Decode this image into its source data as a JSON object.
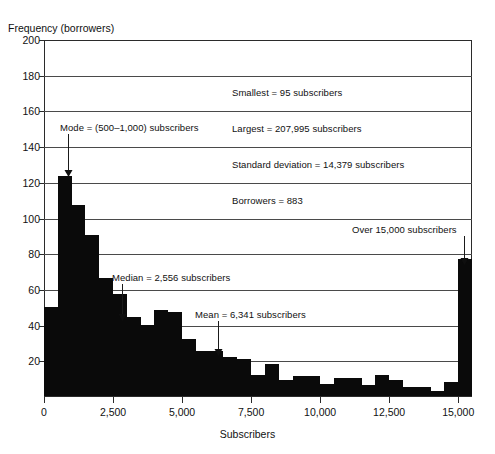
{
  "chart_data": {
    "type": "bar",
    "title": "",
    "subtitle": "",
    "xlabel": "Subscribers",
    "ylabel": "Frequency (borrowers)",
    "xlim": [
      0,
      15500
    ],
    "ylim": [
      0,
      200
    ],
    "grid": true,
    "legend_position": "none",
    "bin_width": 500,
    "x_tick_labels": [
      "0",
      "2,500",
      "5,000",
      "7,500",
      "10,000",
      "12,500",
      "15,000"
    ],
    "x_tick_values": [
      0,
      2500,
      5000,
      7500,
      10000,
      12500,
      15000
    ],
    "y_tick_labels": [
      "20",
      "40",
      "60",
      "80",
      "100",
      "120",
      "140",
      "160",
      "180",
      "200"
    ],
    "y_tick_values": [
      20,
      40,
      60,
      80,
      100,
      120,
      140,
      160,
      180,
      200
    ],
    "bins": [
      {
        "start": 0,
        "end": 500,
        "value": 50
      },
      {
        "start": 500,
        "end": 1000,
        "value": 123
      },
      {
        "start": 1000,
        "end": 1500,
        "value": 107
      },
      {
        "start": 1500,
        "end": 2000,
        "value": 90
      },
      {
        "start": 2000,
        "end": 2500,
        "value": 66
      },
      {
        "start": 2500,
        "end": 3000,
        "value": 57
      },
      {
        "start": 3000,
        "end": 3500,
        "value": 44
      },
      {
        "start": 3500,
        "end": 4000,
        "value": 40
      },
      {
        "start": 4000,
        "end": 4500,
        "value": 48
      },
      {
        "start": 4500,
        "end": 5000,
        "value": 47
      },
      {
        "start": 5000,
        "end": 5500,
        "value": 32
      },
      {
        "start": 5500,
        "end": 6000,
        "value": 25
      },
      {
        "start": 6000,
        "end": 6500,
        "value": 25
      },
      {
        "start": 6500,
        "end": 7000,
        "value": 22
      },
      {
        "start": 7000,
        "end": 7500,
        "value": 21
      },
      {
        "start": 7500,
        "end": 8000,
        "value": 12
      },
      {
        "start": 8000,
        "end": 8500,
        "value": 18
      },
      {
        "start": 8500,
        "end": 9000,
        "value": 9
      },
      {
        "start": 9000,
        "end": 9500,
        "value": 11
      },
      {
        "start": 9500,
        "end": 10000,
        "value": 11
      },
      {
        "start": 10000,
        "end": 10500,
        "value": 7
      },
      {
        "start": 10500,
        "end": 11000,
        "value": 10
      },
      {
        "start": 11000,
        "end": 11500,
        "value": 10
      },
      {
        "start": 11500,
        "end": 12000,
        "value": 6
      },
      {
        "start": 12000,
        "end": 12500,
        "value": 12
      },
      {
        "start": 12500,
        "end": 13000,
        "value": 9
      },
      {
        "start": 13000,
        "end": 13500,
        "value": 5
      },
      {
        "start": 13500,
        "end": 14000,
        "value": 5
      },
      {
        "start": 14000,
        "end": 14500,
        "value": 3
      },
      {
        "start": 14500,
        "end": 15000,
        "value": 8
      },
      {
        "start": 15000,
        "end": 15500,
        "value": 77,
        "overflow": true
      }
    ]
  },
  "axes": {
    "y_title": "Frequency (borrowers)",
    "x_title": "Subscribers"
  },
  "annotations": {
    "mode": "Mode = (500–1,000) subscribers",
    "median": "Median = 2,556 subscribers",
    "mean": "Mean = 6,341 subscribers",
    "smallest": "Smallest = 95 subscribers",
    "largest": "Largest = 207,995 subscribers",
    "std_dev": "Standard deviation = 14,379 subscribers",
    "borrowers": "Borrowers = 883",
    "overflow": "Over 15,000 subscribers"
  },
  "colors": {
    "bar": "#0a0a0a",
    "grid": "#4a4a4a",
    "axis": "#2b2b2b",
    "text": "#111111"
  }
}
